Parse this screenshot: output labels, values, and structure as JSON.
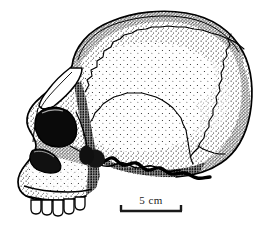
{
  "figure": {
    "view": "left lateral (side) profile",
    "technique": "stipple and line ink drawing",
    "orientation": "facing left",
    "background_color": "#ffffff",
    "ink_color": "#000000"
  },
  "scale_bar": {
    "label": "5 cm",
    "length_value": 5,
    "length_unit": "cm",
    "style": "bracket",
    "bar_x_start_px": 120,
    "bar_x_end_px": 182,
    "bar_y_px": 211,
    "tick_height_px": 6,
    "label_x_px": 151,
    "label_y_px": 204,
    "line_color": "#1a1a1a"
  },
  "anatomy": {
    "regions": [
      {
        "name": "frontal-bone",
        "label": "frontal bone"
      },
      {
        "name": "parietal-bone",
        "label": "parietal bone"
      },
      {
        "name": "occipital-bone",
        "label": "occipital bone"
      },
      {
        "name": "temporal-bone",
        "label": "temporal bone"
      },
      {
        "name": "supraorbital-torus",
        "label": "supraorbital torus (brow ridge)"
      },
      {
        "name": "orbit",
        "label": "orbit (eye socket)"
      },
      {
        "name": "nasal-aperture",
        "label": "nasal aperture"
      },
      {
        "name": "zygomatic-arch",
        "label": "zygomatic arch"
      },
      {
        "name": "maxilla",
        "label": "maxilla"
      },
      {
        "name": "dentition",
        "label": "upper dentition"
      },
      {
        "name": "coronal-suture",
        "label": "coronal suture"
      },
      {
        "name": "lambdoid-suture",
        "label": "lambdoid suture"
      },
      {
        "name": "squamosal-suture",
        "label": "squamosal suture"
      },
      {
        "name": "cranial-base",
        "label": "cranial base"
      }
    ],
    "tooth_count_visible": 5
  }
}
